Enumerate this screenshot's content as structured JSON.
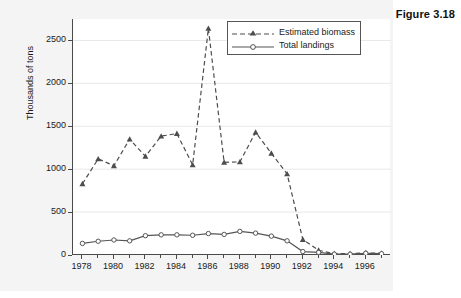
{
  "figure": {
    "title": "Figure 3.18"
  },
  "chart_data": {
    "type": "line",
    "title": "Figure 3.18",
    "xlabel": "",
    "ylabel": "Thousands of tons",
    "xlim": [
      1977.4,
      1997.6
    ],
    "ylim": [
      0,
      2750
    ],
    "grid": true,
    "legend_position": "top-right",
    "x": [
      1978,
      1979,
      1980,
      1981,
      1982,
      1983,
      1984,
      1985,
      1986,
      1987,
      1988,
      1989,
      1990,
      1991,
      1992,
      1993,
      1994,
      1995,
      1996,
      1997
    ],
    "x_tick_labels": [
      "1978",
      "1980",
      "1982",
      "1984",
      "1986",
      "1988",
      "1990",
      "1992",
      "1994",
      "1996"
    ],
    "x_tick_values": [
      1978,
      1980,
      1982,
      1984,
      1986,
      1988,
      1990,
      1992,
      1994,
      1996
    ],
    "y_tick_labels": [
      "0",
      "500",
      "1000",
      "1500",
      "2000",
      "2500"
    ],
    "y_tick_values": [
      0,
      500,
      1000,
      1500,
      2000,
      2500
    ],
    "series": [
      {
        "name": "Estimated biomass",
        "linestyle": "dashed",
        "marker": "triangle",
        "color": "#4d4d4d",
        "values": [
          830,
          1120,
          1040,
          1350,
          1150,
          1385,
          1415,
          1050,
          2640,
          1080,
          1085,
          1430,
          1185,
          945,
          180,
          55,
          15,
          15,
          25,
          20
        ]
      },
      {
        "name": "Total landings",
        "linestyle": "solid",
        "marker": "circle",
        "color": "#555555",
        "values": [
          135,
          160,
          175,
          165,
          225,
          235,
          235,
          230,
          250,
          240,
          275,
          255,
          220,
          165,
          40,
          30,
          10,
          10,
          20,
          15
        ]
      }
    ]
  },
  "legend": {
    "items": [
      {
        "label": "Estimated biomass"
      },
      {
        "label": "Total landings"
      }
    ]
  }
}
